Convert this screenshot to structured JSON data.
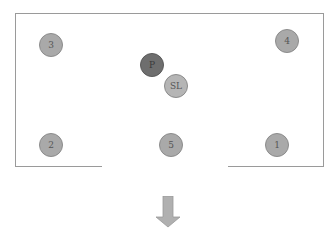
{
  "diagram": {
    "type": "floor-plan",
    "room": {
      "exit": "bottom-center opening",
      "exit_direction": "down"
    },
    "markers": [
      {
        "id": "3",
        "label": "3",
        "x": 51,
        "y": 45,
        "style": "normal"
      },
      {
        "id": "4",
        "label": "4",
        "x": 287,
        "y": 41,
        "style": "normal"
      },
      {
        "id": "P",
        "label": "P",
        "x": 152,
        "y": 65,
        "style": "dark"
      },
      {
        "id": "SL",
        "label": "SL",
        "x": 176,
        "y": 86,
        "style": "light"
      },
      {
        "id": "2",
        "label": "2",
        "x": 51,
        "y": 145,
        "style": "normal"
      },
      {
        "id": "5",
        "label": "5",
        "x": 171,
        "y": 145,
        "style": "normal"
      },
      {
        "id": "1",
        "label": "1",
        "x": 277,
        "y": 145,
        "style": "normal"
      }
    ],
    "colors": {
      "wall": "#9a9a9a",
      "marker": "#a9a9a9",
      "marker_dark": "#6e6e6e",
      "arrow": "#b0b0b0"
    }
  }
}
